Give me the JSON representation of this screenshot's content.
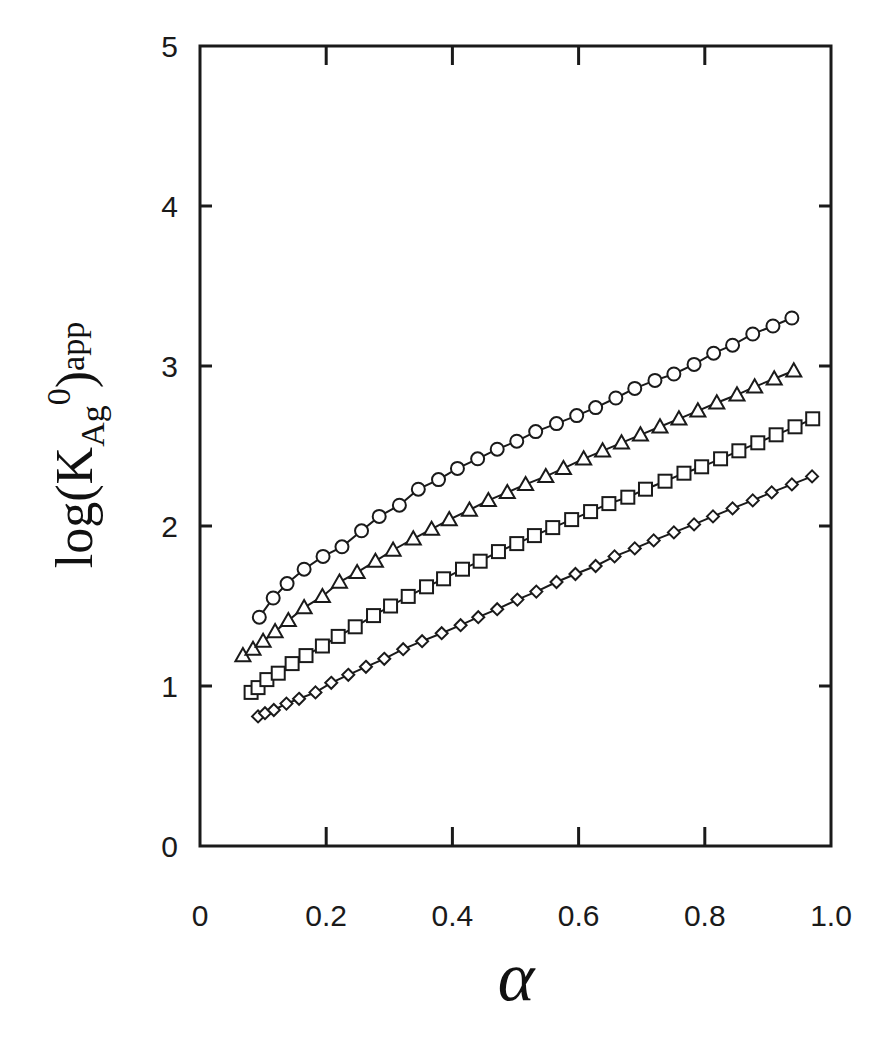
{
  "chart_data": {
    "type": "scatter",
    "title": "",
    "xlabel": "α",
    "ylabel": "log(K_Ag^0)_app",
    "ylabel_parts": {
      "prefix": "log(K",
      "sub": "Ag",
      "sup": "0",
      "suffix": ")",
      "outer_sub": "app"
    },
    "xlim": [
      0,
      1.0
    ],
    "ylim": [
      0,
      5
    ],
    "x_ticks": [
      "0",
      "0.2",
      "0.4",
      "0.6",
      "0.8",
      "1.0"
    ],
    "y_ticks": [
      "0",
      "1",
      "2",
      "3",
      "4",
      "5"
    ],
    "grid": false,
    "legend": "none",
    "series": [
      {
        "name": "circles",
        "marker": "circle",
        "line": true,
        "x": [
          0.094,
          0.116,
          0.138,
          0.165,
          0.195,
          0.225,
          0.256,
          0.284,
          0.316,
          0.346,
          0.378,
          0.408,
          0.44,
          0.471,
          0.502,
          0.532,
          0.565,
          0.597,
          0.627,
          0.659,
          0.689,
          0.721,
          0.751,
          0.783,
          0.814,
          0.844,
          0.876,
          0.908,
          0.938
        ],
        "y": [
          1.43,
          1.55,
          1.64,
          1.73,
          1.81,
          1.87,
          1.97,
          2.06,
          2.13,
          2.23,
          2.29,
          2.36,
          2.42,
          2.48,
          2.53,
          2.59,
          2.64,
          2.69,
          2.74,
          2.8,
          2.86,
          2.91,
          2.95,
          3.01,
          3.08,
          3.13,
          3.2,
          3.25,
          3.3
        ]
      },
      {
        "name": "triangles",
        "marker": "triangle",
        "line": true,
        "x": [
          0.068,
          0.084,
          0.1,
          0.119,
          0.14,
          0.165,
          0.194,
          0.221,
          0.249,
          0.278,
          0.306,
          0.338,
          0.367,
          0.395,
          0.427,
          0.457,
          0.487,
          0.516,
          0.548,
          0.576,
          0.608,
          0.638,
          0.668,
          0.698,
          0.729,
          0.759,
          0.789,
          0.819,
          0.851,
          0.879,
          0.91,
          0.941
        ],
        "y": [
          1.19,
          1.23,
          1.28,
          1.34,
          1.41,
          1.49,
          1.56,
          1.65,
          1.71,
          1.78,
          1.85,
          1.92,
          1.98,
          2.04,
          2.1,
          2.16,
          2.21,
          2.26,
          2.31,
          2.36,
          2.42,
          2.47,
          2.52,
          2.57,
          2.62,
          2.67,
          2.72,
          2.77,
          2.82,
          2.87,
          2.92,
          2.97
        ]
      },
      {
        "name": "squares",
        "marker": "square",
        "line": true,
        "x": [
          0.081,
          0.092,
          0.106,
          0.124,
          0.146,
          0.168,
          0.194,
          0.219,
          0.246,
          0.275,
          0.302,
          0.33,
          0.359,
          0.386,
          0.416,
          0.444,
          0.473,
          0.502,
          0.53,
          0.559,
          0.589,
          0.619,
          0.648,
          0.678,
          0.706,
          0.737,
          0.767,
          0.795,
          0.825,
          0.854,
          0.884,
          0.913,
          0.943,
          0.971
        ],
        "y": [
          0.96,
          0.99,
          1.04,
          1.08,
          1.14,
          1.19,
          1.25,
          1.31,
          1.37,
          1.44,
          1.5,
          1.56,
          1.62,
          1.67,
          1.73,
          1.78,
          1.84,
          1.89,
          1.94,
          1.99,
          2.04,
          2.09,
          2.14,
          2.18,
          2.23,
          2.28,
          2.33,
          2.37,
          2.42,
          2.47,
          2.52,
          2.57,
          2.62,
          2.67
        ]
      },
      {
        "name": "diamonds",
        "marker": "diamond",
        "line": true,
        "x": [
          0.092,
          0.103,
          0.117,
          0.137,
          0.157,
          0.183,
          0.208,
          0.235,
          0.263,
          0.292,
          0.322,
          0.352,
          0.383,
          0.413,
          0.441,
          0.471,
          0.503,
          0.533,
          0.565,
          0.595,
          0.627,
          0.657,
          0.689,
          0.719,
          0.751,
          0.783,
          0.813,
          0.844,
          0.876,
          0.906,
          0.938,
          0.97
        ],
        "y": [
          0.81,
          0.83,
          0.85,
          0.89,
          0.92,
          0.96,
          1.02,
          1.07,
          1.12,
          1.17,
          1.23,
          1.28,
          1.33,
          1.38,
          1.43,
          1.48,
          1.54,
          1.59,
          1.65,
          1.7,
          1.75,
          1.81,
          1.86,
          1.91,
          1.96,
          2.01,
          2.06,
          2.11,
          2.16,
          2.21,
          2.26,
          2.31
        ]
      }
    ]
  },
  "colors": {
    "ink": "#1a1a1a",
    "background": "#ffffff"
  }
}
